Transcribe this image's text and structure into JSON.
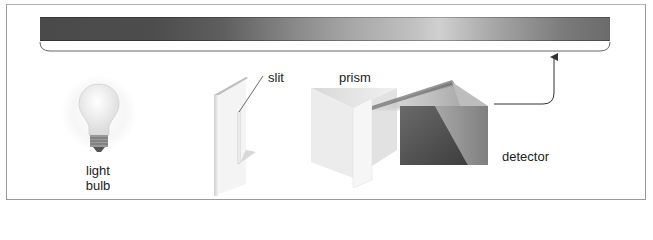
{
  "diagram": {
    "title": "",
    "style": "grayscale schematic of a spectroscope",
    "components": [
      {
        "id": "light-bulb",
        "label_line1": "light",
        "label_line2": "bulb"
      },
      {
        "id": "slit",
        "label": "slit"
      },
      {
        "id": "prism",
        "label": "prism"
      },
      {
        "id": "detector",
        "label": "detector"
      }
    ],
    "spectrum_band": {
      "description": "horizontal continuous spectrum band with brace beneath",
      "gradient_stops": [
        "#4a4a4a",
        "#5e5e5e",
        "#8a8a8a",
        "#c2c2c2",
        "#d0d0d0",
        "#a5a5a5",
        "#6b6b6b"
      ]
    },
    "arrow": {
      "from": "detector",
      "to": "spectrum_band"
    }
  }
}
